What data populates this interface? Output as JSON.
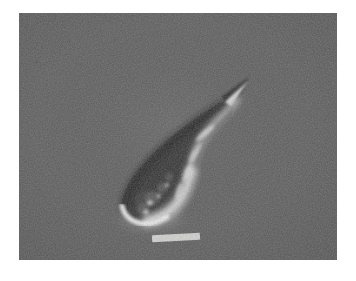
{
  "page": {
    "background_color": "#ffffff"
  },
  "micrograph": {
    "description": "Grayscale light micrograph of a single elongated curved cell with a dark upper-left side, a bright highlighted lower-right side, a pointed spiked tip at the upper right and a rounded bulbous base at the lower left, on a uniform gray background",
    "background_color": "#595959",
    "cell": {
      "body_color": "#2b2b2b",
      "shadow_edge_color": "#161616",
      "highlight_color": "#e9e9e9",
      "rim_light_color": "#ffffff",
      "spike_dark_color": "#222222",
      "spike_highlight_color": "#dcdcdc",
      "mottle_gray_color": "#6f6f6f"
    },
    "scale_bar_color": "#d9dbd8"
  }
}
